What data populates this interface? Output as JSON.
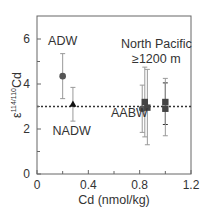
{
  "chart_data": {
    "type": "scatter",
    "title": "",
    "xlabel": "Cd (nmol/kg)",
    "ylabel_main": "ε",
    "ylabel_sup": "114/110",
    "ylabel_tail": "Cd",
    "xlim": [
      0,
      1.2
    ],
    "ylim": [
      0,
      7
    ],
    "xticks": [
      0,
      0.4,
      0.8,
      1.2
    ],
    "xtick_labels": [
      "0",
      "0.4",
      "0.8",
      "1.2"
    ],
    "xminor_ticks": [
      0.2,
      0.6,
      1.0
    ],
    "yticks": [
      0,
      2,
      4,
      6
    ],
    "ytick_labels": [
      "0",
      "2",
      "4",
      "6"
    ],
    "yminor_ticks": [
      1,
      3,
      5
    ],
    "grid": false,
    "reference_line": {
      "y": 3.0,
      "style": "dotted"
    },
    "series": [
      {
        "name": "ADW",
        "marker": "circle",
        "color": "#555555",
        "points": [
          {
            "x": 0.2,
            "y": 4.35,
            "ylow": 3.35,
            "yhigh": 5.35
          }
        ]
      },
      {
        "name": "NADW",
        "marker": "triangle",
        "color": "#111111",
        "points": [
          {
            "x": 0.28,
            "y": 3.1,
            "ylow": 2.35,
            "yhigh": 3.85
          }
        ]
      },
      {
        "name": "AABW",
        "marker": "circle",
        "color": "#555555",
        "points": [
          {
            "x": 0.82,
            "y": 2.9,
            "ylow": 1.85,
            "yhigh": 3.95
          }
        ]
      },
      {
        "name": "North Pacific ≥1200 m",
        "marker": "square",
        "color": "#444444",
        "points": [
          {
            "x": 0.84,
            "y": 3.2,
            "ylow": 1.65,
            "yhigh": 4.75
          },
          {
            "x": 0.86,
            "y": 2.95,
            "ylow": 1.3,
            "yhigh": 4.65
          },
          {
            "x": 1.0,
            "y": 3.2,
            "ylow": 2.2,
            "yhigh": 4.05
          },
          {
            "x": 1.0,
            "y": 2.9,
            "ylow": 1.7,
            "yhigh": 4.25
          }
        ]
      }
    ],
    "annotations": [
      {
        "text": "ADW",
        "x": 0.2,
        "y": 5.75
      },
      {
        "text": "NADW",
        "x": 0.27,
        "y": 1.75
      },
      {
        "text": "AABW",
        "x": 0.72,
        "y": 2.55
      },
      {
        "text": "North Pacific",
        "x": 0.93,
        "y": 5.6
      },
      {
        "text": "≥1200 m",
        "x": 0.93,
        "y": 4.95
      }
    ]
  }
}
